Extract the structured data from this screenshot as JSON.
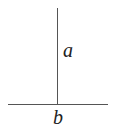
{
  "diagram": {
    "type": "perpendicular-lines",
    "labels": {
      "vertical": "a",
      "horizontal": "b"
    },
    "line_color": "#555555",
    "text_color": "#222222"
  }
}
